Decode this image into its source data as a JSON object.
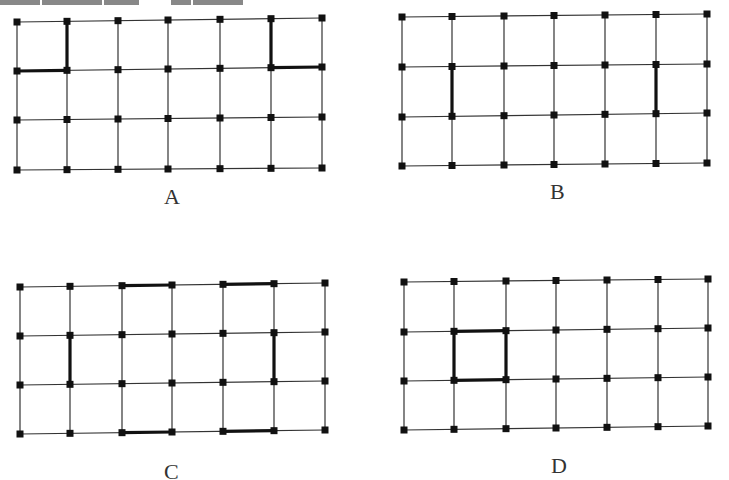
{
  "figure": {
    "colors": {
      "line": "#333333",
      "bold_line": "#111111",
      "node": "#111111",
      "background": "#ffffff"
    },
    "top_text_cutoff": true,
    "panels": [
      {
        "label": "A",
        "cols": 7,
        "rows": 4,
        "x": [
          17,
          67,
          118,
          168,
          220,
          271,
          322
        ],
        "y_left": [
          22,
          71,
          120,
          170
        ],
        "y_right": [
          18,
          67,
          117,
          168
        ],
        "bold_edges": [
          [
            [
              1,
              0
            ],
            [
              1,
              1
            ]
          ],
          [
            [
              0,
              1
            ],
            [
              1,
              1
            ]
          ],
          [
            [
              5,
              0
            ],
            [
              5,
              1
            ]
          ],
          [
            [
              5,
              1
            ],
            [
              6,
              1
            ]
          ]
        ],
        "label_pos": [
          172,
          198
        ]
      },
      {
        "label": "B",
        "cols": 7,
        "rows": 4,
        "x": [
          402,
          452,
          504,
          554,
          605,
          656,
          707
        ],
        "y_left": [
          17,
          67,
          117,
          166
        ],
        "y_right": [
          14,
          64,
          113,
          163
        ],
        "bold_edges": [
          [
            [
              1,
              1
            ],
            [
              1,
              2
            ]
          ],
          [
            [
              5,
              1
            ],
            [
              5,
              2
            ]
          ]
        ],
        "label_pos": [
          558,
          193
        ]
      },
      {
        "label": "C",
        "cols": 7,
        "rows": 4,
        "x": [
          20,
          70,
          122,
          172,
          223,
          274,
          325
        ],
        "y_left": [
          287,
          336,
          385,
          434
        ],
        "y_right": [
          283,
          332,
          381,
          430
        ],
        "bold_edges": [
          [
            [
              2,
              0
            ],
            [
              3,
              0
            ]
          ],
          [
            [
              4,
              0
            ],
            [
              5,
              0
            ]
          ],
          [
            [
              1,
              1
            ],
            [
              1,
              2
            ]
          ],
          [
            [
              5,
              1
            ],
            [
              5,
              2
            ]
          ],
          [
            [
              2,
              3
            ],
            [
              3,
              3
            ]
          ],
          [
            [
              4,
              3
            ],
            [
              5,
              3
            ]
          ]
        ],
        "label_pos": [
          172,
          473
        ]
      },
      {
        "label": "D",
        "cols": 7,
        "rows": 4,
        "x": [
          404,
          454,
          506,
          556,
          607,
          658,
          708
        ],
        "y_left": [
          282,
          332,
          381,
          430
        ],
        "y_right": [
          279,
          328,
          377,
          426
        ],
        "bold_edges": [
          [
            [
              1,
              1
            ],
            [
              2,
              1
            ]
          ],
          [
            [
              2,
              1
            ],
            [
              2,
              2
            ]
          ],
          [
            [
              1,
              2
            ],
            [
              2,
              2
            ]
          ],
          [
            [
              1,
              1
            ],
            [
              1,
              2
            ]
          ]
        ],
        "label_pos": [
          559,
          467
        ]
      }
    ]
  }
}
